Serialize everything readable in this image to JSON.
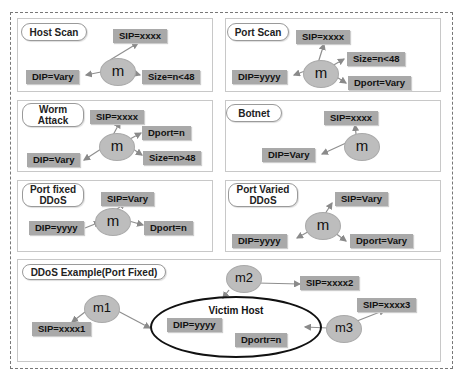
{
  "panels": [
    {
      "title": "Host Scan",
      "center": "m",
      "boxes": [
        "SIP=xxxx",
        "DIP=Vary",
        "Size=n<48"
      ]
    },
    {
      "title": "Port Scan",
      "center": "m",
      "boxes": [
        "SIP=xxxx",
        "DIP=yyyy",
        "Size=n<48",
        "Dport=Vary"
      ]
    },
    {
      "title": "Worm Attack",
      "center": "m",
      "boxes": [
        "SIP=xxxx",
        "DIP=Vary",
        "Dport=n",
        "Size=n>48"
      ]
    },
    {
      "title": "Botnet",
      "center": "m",
      "boxes": [
        "SIP=xxxx",
        "DIP=Vary"
      ]
    },
    {
      "title": "Port fixed DDoS",
      "center": "m",
      "boxes": [
        "SIP=Vary",
        "DIP=yyyy",
        "Dport=n"
      ]
    },
    {
      "title": "Port Varied DDoS",
      "center": "m",
      "boxes": [
        "SIP=Vary",
        "DIP=yyyy",
        "Dport=Vary"
      ]
    }
  ],
  "example": {
    "title": "DDoS Example(Port Fixed)",
    "nodes": [
      "m1",
      "m2",
      "m3"
    ],
    "sources": [
      "SIP=xxxx1",
      "SIP=xxxx2",
      "SIP=xxxx3"
    ],
    "victim": {
      "label": "Victim Host",
      "dip": "DIP=yyyy",
      "dport": "Dportr=n"
    }
  },
  "colors": {
    "box": "#a9a9a9",
    "node": "#bdbdbd",
    "arrow": "#8a8a8a"
  }
}
